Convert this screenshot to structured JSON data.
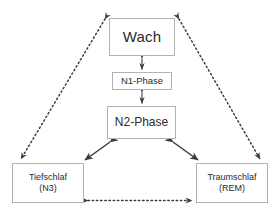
{
  "diagram": {
    "background_color": "#ffffff",
    "box_border_color": "#b3b3b3",
    "text_color": "#2b2b2b",
    "edge_color": "#3a3a3a",
    "nodes": {
      "wach": {
        "label": "Wach"
      },
      "n1": {
        "label": "N1-Phase"
      },
      "n2": {
        "label": "N2-Phase"
      },
      "n3": {
        "line1": "Tiefschlaf",
        "line2": "(N3)"
      },
      "rem": {
        "line1": "Traumschlaf",
        "line2": "(REM)"
      }
    },
    "edges": [
      {
        "id": "wach-n1",
        "from": "wach",
        "to": "n1",
        "style": "solid",
        "arrows": "both"
      },
      {
        "id": "n1-n2",
        "from": "n1",
        "to": "n2",
        "style": "solid",
        "arrows": "both"
      },
      {
        "id": "n2-n3",
        "from": "n2",
        "to": "n3",
        "style": "solid",
        "arrows": "both"
      },
      {
        "id": "n2-rem",
        "from": "n2",
        "to": "rem",
        "style": "solid",
        "arrows": "both"
      },
      {
        "id": "wach-n3",
        "from": "wach",
        "to": "n3",
        "style": "dotted",
        "arrows": "both"
      },
      {
        "id": "wach-rem",
        "from": "wach",
        "to": "rem",
        "style": "dotted",
        "arrows": "both"
      },
      {
        "id": "n3-rem",
        "from": "n3",
        "to": "rem",
        "style": "dotted",
        "arrows": "both"
      }
    ]
  }
}
